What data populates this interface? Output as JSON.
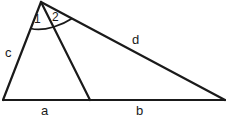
{
  "diagram": {
    "type": "triangle-with-cevian",
    "vertices": {
      "apex": [
        41,
        2
      ],
      "bottom_left": [
        3,
        100
      ],
      "cevian_foot": [
        90,
        100
      ],
      "bottom_right": [
        225,
        100
      ]
    },
    "segments": [
      {
        "id": "c",
        "from": "apex",
        "to": "bottom_left"
      },
      {
        "id": "cevian",
        "from": "apex",
        "to": "cevian_foot"
      },
      {
        "id": "d",
        "from": "apex",
        "to": "bottom_right"
      },
      {
        "id": "a",
        "from": "bottom_left",
        "to": "cevian_foot"
      },
      {
        "id": "b",
        "from": "cevian_foot",
        "to": "bottom_right"
      }
    ],
    "side_labels": {
      "c": "c",
      "d": "d",
      "a": "a",
      "b": "b"
    },
    "angle_labels": {
      "angle1": "1",
      "angle2": "2"
    },
    "line_color": "#1a1a1a",
    "background": "#ffffff"
  }
}
